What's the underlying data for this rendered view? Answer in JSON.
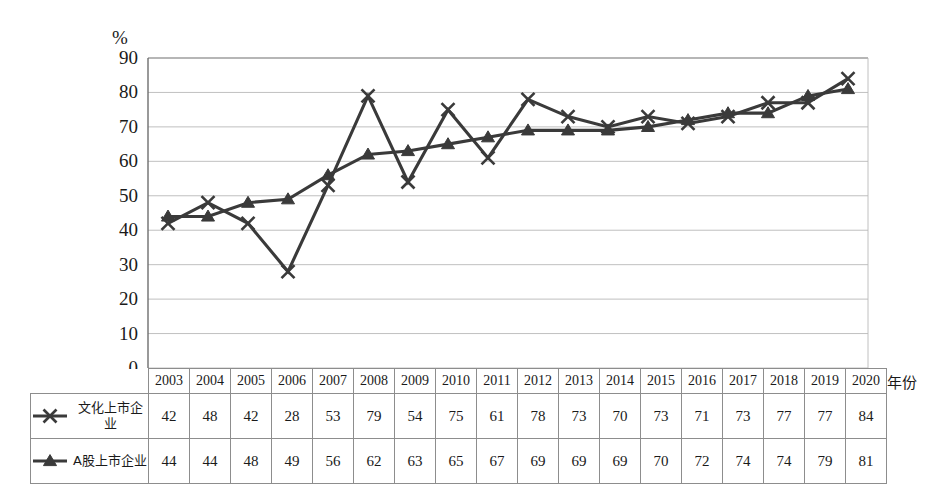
{
  "chart_data": {
    "type": "line",
    "title": "",
    "xlabel": "年份",
    "ylabel": "%",
    "ylim": [
      0,
      90
    ],
    "ytick_step": 10,
    "yticks": [
      "90",
      "80",
      "70",
      "60",
      "50",
      "40",
      "30",
      "20",
      "10",
      "0"
    ],
    "grid": true,
    "legend_position": "table-left",
    "categories": [
      "2003",
      "2004",
      "2005",
      "2006",
      "2007",
      "2008",
      "2009",
      "2010",
      "2011",
      "2012",
      "2013",
      "2014",
      "2015",
      "2016",
      "2017",
      "2018",
      "2019",
      "2020"
    ],
    "series": [
      {
        "name": "文化上市企业",
        "marker": "x-cross",
        "color": "#3a3a3a",
        "values": [
          42,
          48,
          42,
          28,
          53,
          79,
          54,
          75,
          61,
          78,
          73,
          70,
          73,
          71,
          73,
          77,
          77,
          84
        ]
      },
      {
        "name": "A股上市企业",
        "marker": "triangle",
        "color": "#3a3a3a",
        "values": [
          44,
          44,
          48,
          49,
          56,
          62,
          63,
          65,
          67,
          69,
          69,
          69,
          70,
          72,
          74,
          74,
          79,
          81
        ]
      }
    ]
  },
  "axis": {
    "unit_label": "%",
    "year_label": "年份"
  },
  "colors": {
    "line": "#3a3a3a",
    "grid": "#b9b9b9",
    "axis": "#6e6e6e",
    "table_border": "#8d8d8d",
    "text": "#1a1a1a"
  }
}
